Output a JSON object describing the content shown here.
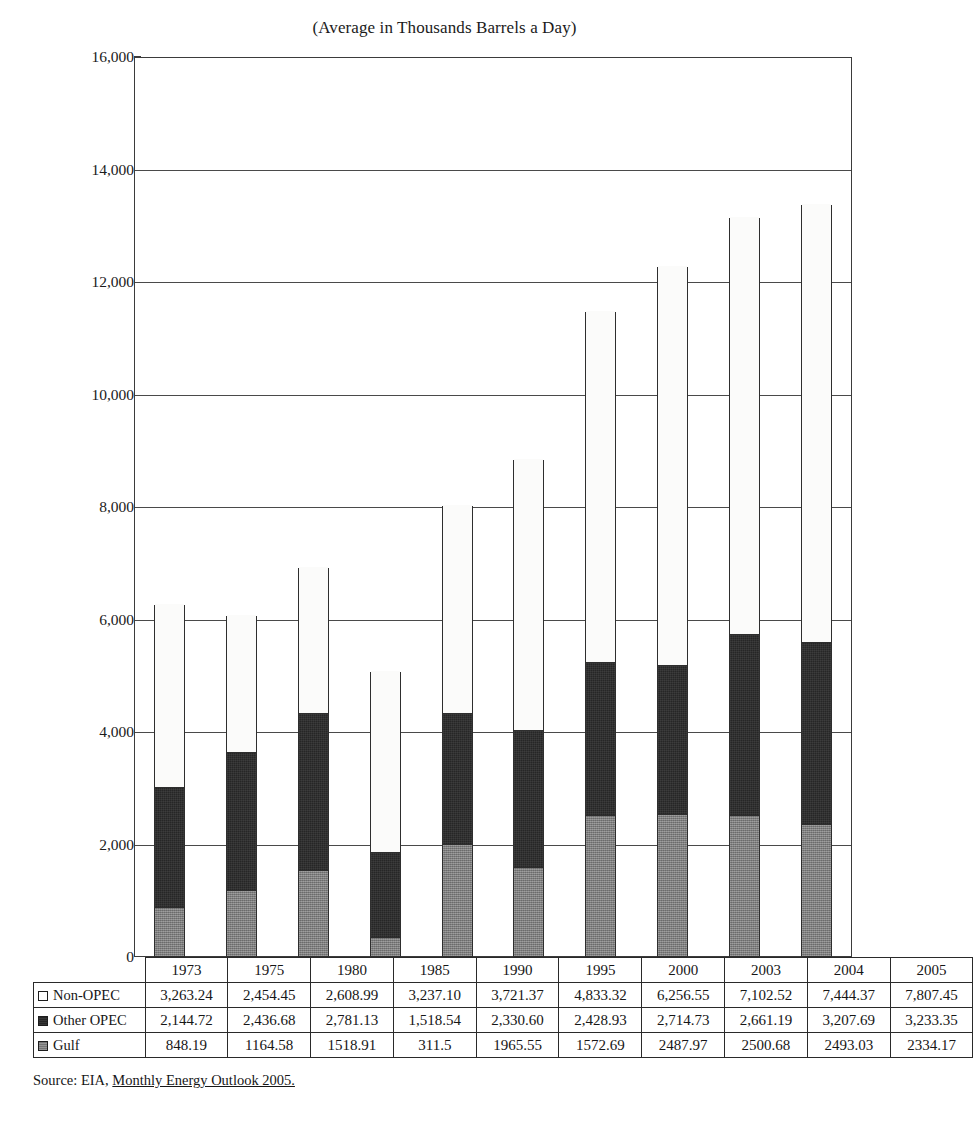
{
  "chart_data": {
    "type": "bar",
    "subtype": "stacked-column",
    "title": "(Average in Thousands Barrels a Day)",
    "xlabel": "",
    "ylabel": "",
    "ylim": [
      0,
      16000
    ],
    "ytick_step": 2000,
    "yticks": [
      "0",
      "2,000",
      "4,000",
      "6,000",
      "8,000",
      "10,000",
      "12,000",
      "14,000",
      "16,000"
    ],
    "grid": true,
    "legend_position": "table-left",
    "categories": [
      "1973",
      "1975",
      "1980",
      "1985",
      "1990",
      "1995",
      "2000",
      "2003",
      "2004",
      "2005"
    ],
    "stack_order_bottom_to_top": [
      "Gulf",
      "Other OPEC",
      "Non-OPEC"
    ],
    "series": [
      {
        "name": "Non-OPEC",
        "color": "#ffffff",
        "values": [
          3263.24,
          2454.45,
          2608.99,
          3237.1,
          3721.37,
          4833.32,
          6256.55,
          7102.52,
          7444.37,
          7807.45
        ],
        "labels": [
          "3,263.24",
          "2,454.45",
          "2,608.99",
          "3,237.10",
          "3,721.37",
          "4,833.32",
          "6,256.55",
          "7,102.52",
          "7,444.37",
          "7,807.45"
        ]
      },
      {
        "name": "Other OPEC",
        "color": "#262626",
        "values": [
          2144.72,
          2436.68,
          2781.13,
          1518.54,
          2330.6,
          2428.93,
          2714.73,
          2661.19,
          3207.69,
          3233.35
        ],
        "labels": [
          "2,144.72",
          "2,436.68",
          "2,781.13",
          "1,518.54",
          "2,330.60",
          "2,428.93",
          "2,714.73",
          "2,661.19",
          "3,207.69",
          "3,233.35"
        ]
      },
      {
        "name": "Gulf",
        "color": "#7e7e7e",
        "values": [
          848.19,
          1164.58,
          1518.91,
          311.5,
          1965.55,
          1572.69,
          2487.97,
          2500.68,
          2493.03,
          2334.17
        ],
        "labels": [
          "848.19",
          "1164.58",
          "1518.91",
          "311.5",
          "1965.55",
          "1572.69",
          "2487.97",
          "2500.68",
          "2493.03",
          "2334.17"
        ]
      }
    ]
  },
  "table": {
    "corner_label": "",
    "column_headers": [
      "1973",
      "1975",
      "1980",
      "1985",
      "1990",
      "1995",
      "2000",
      "2003",
      "2004",
      "2005"
    ],
    "rows": [
      {
        "label": "Non-OPEC",
        "swatch": "swatch-nonopec",
        "values": [
          "3,263.24",
          "2,454.45",
          "2,608.99",
          "3,237.10",
          "3,721.37",
          "4,833.32",
          "6,256.55",
          "7,102.52",
          "7,444.37",
          "7,807.45"
        ]
      },
      {
        "label": "Other OPEC",
        "swatch": "swatch-otheropec",
        "values": [
          "2,144.72",
          "2,436.68",
          "2,781.13",
          "1,518.54",
          "2,330.60",
          "2,428.93",
          "2,714.73",
          "2,661.19",
          "3,207.69",
          "3,233.35"
        ]
      },
      {
        "label": "Gulf",
        "swatch": "swatch-gulf",
        "values": [
          "848.19",
          "1164.58",
          "1518.91",
          "311.5",
          "1965.55",
          "1572.69",
          "2487.97",
          "2500.68",
          "2493.03",
          "2334.17"
        ]
      }
    ]
  },
  "source": {
    "prefix": "Source: EIA, ",
    "document": "Monthly Energy Outlook 2005."
  }
}
